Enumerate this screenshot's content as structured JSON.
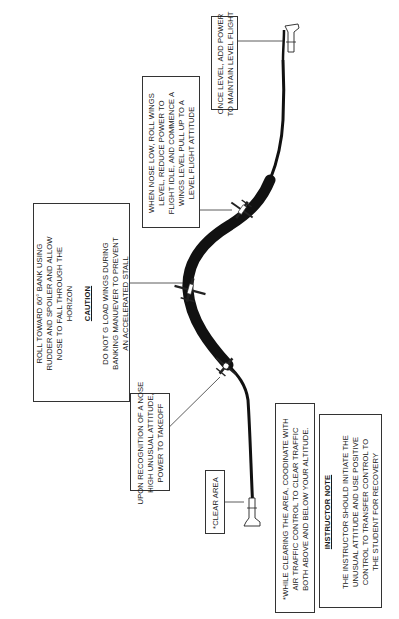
{
  "figure": {
    "orientation": "rotated 90 degrees counterclockwise",
    "callouts": {
      "clear_area": {
        "lines": [
          "*CLEAR AREA"
        ]
      },
      "nose_high": {
        "lines": [
          "UPON RECOGNITION OF A NOSE",
          "HIGH UNUSUAL ATTITUDE,",
          "POWER TO TAKEOFF"
        ]
      },
      "roll_toward": {
        "lines": [
          "ROLL TOWARD 60° BANK USING",
          "RUDDER AND SPOILER AND ALLOW",
          "NOSE TO FALL THROUGH THE",
          "HORIZON"
        ],
        "caution_heading": "CAUTION",
        "caution_lines": [
          "DO NOT G LOAD WINGS DURING",
          "BANKING MANUEVER TO PREVENT",
          "AN ACCELERATED STALL"
        ]
      },
      "nose_low": {
        "lines": [
          "WHEN NOSE LOW, ROLL WINGS",
          "LEVEL, REDUCE POWER TO",
          "FLIGHT IDLE, AND COMMENCE A",
          "WINGS LEVEL PULL UP TO A",
          "LEVEL FLIGHT ATTITUDE"
        ]
      },
      "once_level": {
        "lines": [
          "ONCE LEVEL, ADD POWER",
          "TO MAINTAIN LEVEL FLIGHT"
        ]
      },
      "while_clearing": {
        "lines": [
          "*WHILE CLEARING THE AREA, COODINATE WITH",
          "AIR TRAFFIC CONTROL TO CLEAR TRAFFIC",
          "BOTH ABOVE AND BELOW YOUR ALTITUDE."
        ]
      },
      "instructor_note": {
        "heading": "INSTRUCTOR NOTE",
        "lines": [
          "THE INSTRUCTOR SHOULD INITIATE THE",
          "UNUSUAL ATTITUDE AND USE POSITIVE",
          "CONTROL TO TRANSFER CONTROL TO",
          "THE STUDENT FOR RECOVERY"
        ]
      }
    },
    "aircraft_positions": [
      "start-level",
      "nose-high",
      "60-degree-bank",
      "nose-low-recovery",
      "level-flight"
    ],
    "colors": {
      "path": "#111111",
      "border": "#333333",
      "background": "#ffffff"
    }
  }
}
